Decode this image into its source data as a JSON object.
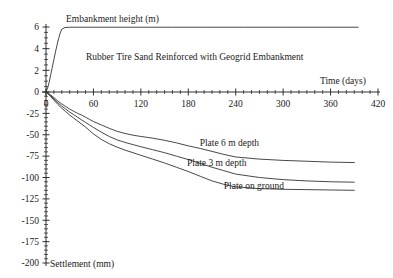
{
  "chart_data": {
    "type": "line",
    "title": "Rubber Tire Sand Reinforced with Geogrid Embankment",
    "xlabel": "Time (days)",
    "ylabel_top": "Embankment height (m)",
    "ylabel_bottom": "Settlement (mm)",
    "grid": false,
    "legend_position": "inline-annotations",
    "xlim": [
      0,
      420
    ],
    "xticks": [
      0,
      60,
      120,
      180,
      240,
      300,
      360,
      420
    ],
    "xtick_labels": [
      "0",
      "60",
      "120",
      "180",
      "240",
      "300",
      "360",
      "420"
    ],
    "x_minor_step": 10,
    "y_upper_lim": [
      0,
      6
    ],
    "y_upper_ticks": [
      0,
      2,
      4,
      6
    ],
    "y_upper_tick_labels": [
      "0",
      "2",
      "4",
      "6"
    ],
    "y_lower_lim": [
      -200,
      0
    ],
    "y_lower_ticks": [
      0,
      -25,
      -50,
      -75,
      -100,
      -125,
      -150,
      -175,
      -200
    ],
    "y_lower_tick_labels": [
      "0",
      "-25",
      "-50",
      "-75",
      "-100",
      "-125",
      "-150",
      "-175",
      "-200"
    ],
    "y_lower_minor_step": 5,
    "series": [
      {
        "name": "Embankment height",
        "axis": "upper",
        "units": "m",
        "label": "",
        "x": [
          0,
          2,
          4,
          6,
          8,
          10,
          12,
          14,
          16,
          18,
          20,
          24,
          30,
          40,
          60,
          90,
          120,
          160,
          200,
          250,
          300,
          350,
          395
        ],
        "y": [
          0.0,
          0.35,
          0.9,
          1.6,
          2.3,
          3.0,
          3.7,
          4.35,
          4.95,
          5.45,
          5.8,
          5.95,
          5.98,
          5.98,
          5.98,
          5.98,
          5.98,
          5.98,
          5.98,
          5.98,
          5.98,
          5.98,
          5.98
        ]
      },
      {
        "name": "Plate 6 m depth",
        "axis": "lower",
        "units": "mm",
        "label": "Plate 6 m depth",
        "label_x": 232,
        "label_y": -63,
        "x": [
          0,
          3,
          6,
          10,
          15,
          20,
          25,
          30,
          35,
          40,
          45,
          50,
          55,
          60,
          70,
          80,
          90,
          100,
          110,
          120,
          135,
          150,
          165,
          180,
          195,
          210,
          225,
          240,
          270,
          300,
          330,
          360,
          390
        ],
        "y": [
          0,
          -1.5,
          -3.5,
          -6.5,
          -10.5,
          -14,
          -17,
          -20,
          -22.5,
          -25,
          -27,
          -29.5,
          -32,
          -34.5,
          -38.5,
          -42.5,
          -46,
          -48.5,
          -50.5,
          -52,
          -54,
          -56.5,
          -59.5,
          -63,
          -66,
          -69.5,
          -73,
          -76,
          -78.5,
          -80,
          -81,
          -82,
          -82.5
        ]
      },
      {
        "name": "Plate 3 m depth",
        "axis": "lower",
        "units": "mm",
        "label": "Plate 3 m depth",
        "label_x": 216,
        "label_y": -87,
        "x": [
          0,
          3,
          6,
          10,
          15,
          20,
          25,
          30,
          35,
          40,
          45,
          50,
          55,
          60,
          70,
          80,
          90,
          100,
          110,
          120,
          135,
          150,
          165,
          180,
          195,
          210,
          225,
          240,
          270,
          300,
          330,
          360,
          390
        ],
        "y": [
          0,
          -2,
          -4.5,
          -8,
          -12.5,
          -16.5,
          -20,
          -23.5,
          -26.5,
          -29.5,
          -32.5,
          -35.5,
          -38.5,
          -41.5,
          -47,
          -52,
          -56,
          -59,
          -61.5,
          -64,
          -67.5,
          -71,
          -75,
          -79,
          -83.5,
          -88,
          -92,
          -96,
          -100,
          -102.5,
          -104,
          -105,
          -105.5
        ]
      },
      {
        "name": "Plate on ground",
        "axis": "lower",
        "units": "mm",
        "label": "Plate on ground",
        "label_x": 263,
        "label_y": -114,
        "x": [
          0,
          3,
          6,
          10,
          15,
          20,
          25,
          30,
          35,
          40,
          45,
          50,
          55,
          60,
          70,
          80,
          90,
          100,
          110,
          120,
          135,
          150,
          165,
          180,
          195,
          210,
          225,
          240,
          270,
          300,
          330,
          360,
          390
        ],
        "y": [
          0,
          -2.5,
          -5.5,
          -9.5,
          -14.5,
          -19,
          -23,
          -27,
          -30.5,
          -34,
          -37.5,
          -41,
          -45,
          -49,
          -55.5,
          -60.5,
          -64.5,
          -68,
          -71,
          -74,
          -78.5,
          -83,
          -88,
          -93,
          -98.5,
          -104,
          -108,
          -111,
          -113,
          -113.8,
          -114.2,
          -114.6,
          -115
        ]
      }
    ]
  }
}
